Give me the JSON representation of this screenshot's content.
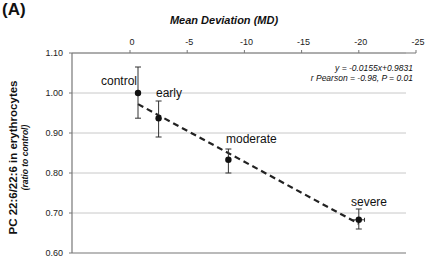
{
  "panel_label": "(A)",
  "chart_data": {
    "type": "scatter",
    "title": "",
    "xlabel": "Mean Deviation (MD)",
    "ylabel": "PC 22:6/22:6 in erythrocytes",
    "ylabel_sub": "(ratio to control)",
    "x_axis_position": "top",
    "x_ticks": [
      "0",
      "-5",
      "-10",
      "-15",
      "-20",
      "-25"
    ],
    "x_tick_values": [
      0,
      -5,
      -10,
      -15,
      -20,
      -25
    ],
    "xlim": [
      5,
      -25
    ],
    "y_ticks": [
      "1.10",
      "1.00",
      "0.90",
      "0.80",
      "0.70",
      "0.60"
    ],
    "y_tick_values": [
      1.1,
      1.0,
      0.9,
      0.8,
      0.7,
      0.6
    ],
    "ylim": [
      0.6,
      1.1
    ],
    "grid": "horizontal",
    "points": [
      {
        "label": "control",
        "x": -0.7,
        "y": 1.0,
        "y_err_low": 0.937,
        "y_err_high": 1.065,
        "x_err": 0
      },
      {
        "label": "early",
        "x": -2.5,
        "y": 0.937,
        "y_err_low": 0.89,
        "y_err_high": 0.98,
        "x_err": 0
      },
      {
        "label": "moderate",
        "x": -8.6,
        "y": 0.833,
        "y_err_low": 0.8,
        "y_err_high": 0.86,
        "x_err": 0
      },
      {
        "label": "severe",
        "x": -20.0,
        "y": 0.683,
        "y_err_low": 0.66,
        "y_err_high": 0.71,
        "x_err": 0.5
      }
    ],
    "regression": {
      "equation": "y = -0.0155x+0.9831",
      "stats": "r Pearson = -0.98, P = 0.01",
      "slope": -0.0155,
      "intercept": 0.9831,
      "style": "dashed"
    }
  }
}
